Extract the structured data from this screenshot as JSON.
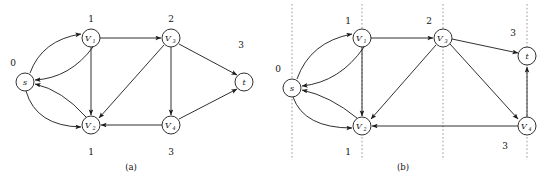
{
  "figure": {
    "type": "directed-graph-diagram",
    "panels": [
      {
        "id": "a",
        "caption": "(a)",
        "caption_x": 131,
        "caption_y": 170,
        "nodes": [
          {
            "id": "s",
            "label": "s",
            "sub": "",
            "cx": 25,
            "cy": 82,
            "r": 9,
            "dist": "0",
            "dist_x": 13,
            "dist_y": 62
          },
          {
            "id": "v1",
            "label": "V",
            "sub": "1",
            "cx": 91,
            "cy": 38,
            "r": 9,
            "dist": "1",
            "dist_x": 91,
            "dist_y": 18
          },
          {
            "id": "v3",
            "label": "V",
            "sub": "3",
            "cx": 171,
            "cy": 38,
            "r": 9,
            "dist": "2",
            "dist_x": 171,
            "dist_y": 18
          },
          {
            "id": "t",
            "label": "t",
            "sub": "",
            "cx": 244,
            "cy": 82,
            "r": 9,
            "dist": "3",
            "dist_x": 241,
            "dist_y": 44
          },
          {
            "id": "v2",
            "label": "V",
            "sub": "2",
            "cx": 91,
            "cy": 125,
            "r": 9,
            "dist": "1",
            "dist_x": 91,
            "dist_y": 153
          },
          {
            "id": "v4",
            "label": "V",
            "sub": "4",
            "cx": 171,
            "cy": 125,
            "r": 9,
            "dist": "3",
            "dist_x": 171,
            "dist_y": 153
          }
        ],
        "edges": [
          {
            "from": "s",
            "to": "v1",
            "shape": "curve-up"
          },
          {
            "from": "v1",
            "to": "s",
            "shape": "curve-down"
          },
          {
            "from": "s",
            "to": "v2",
            "shape": "curve-down"
          },
          {
            "from": "v2",
            "to": "s",
            "shape": "curve-up"
          },
          {
            "from": "v1",
            "to": "v3",
            "shape": "straight"
          },
          {
            "from": "v1",
            "to": "v2",
            "shape": "straight"
          },
          {
            "from": "v3",
            "to": "v2",
            "shape": "straight"
          },
          {
            "from": "v3",
            "to": "v4",
            "shape": "straight"
          },
          {
            "from": "v3",
            "to": "t",
            "shape": "straight"
          },
          {
            "from": "v4",
            "to": "v2",
            "shape": "straight"
          },
          {
            "from": "v4",
            "to": "t",
            "shape": "straight"
          }
        ],
        "dashed_lines": []
      },
      {
        "id": "b",
        "caption": "(b)",
        "caption_x": 403,
        "caption_y": 170,
        "nodes": [
          {
            "id": "s",
            "label": "s",
            "sub": "",
            "cx": 292,
            "cy": 88,
            "r": 9,
            "dist": "0",
            "dist_x": 278,
            "dist_y": 68
          },
          {
            "id": "v1",
            "label": "V",
            "sub": "1",
            "cx": 362,
            "cy": 38,
            "r": 9,
            "dist": "1",
            "dist_x": 348,
            "dist_y": 20
          },
          {
            "id": "v3",
            "label": "V",
            "sub": "3",
            "cx": 443,
            "cy": 38,
            "r": 9,
            "dist": "2",
            "dist_x": 429,
            "dist_y": 20
          },
          {
            "id": "t",
            "label": "t",
            "sub": "",
            "cx": 527,
            "cy": 56,
            "r": 9,
            "dist": "3",
            "dist_x": 513,
            "dist_y": 32
          },
          {
            "id": "v2",
            "label": "V",
            "sub": "2",
            "cx": 362,
            "cy": 126,
            "r": 9,
            "dist": "1",
            "dist_x": 348,
            "dist_y": 152
          },
          {
            "id": "v4",
            "label": "V",
            "sub": "4",
            "cx": 527,
            "cy": 126,
            "r": 9,
            "dist": "3",
            "dist_x": 505,
            "dist_y": 146
          }
        ],
        "edges": [
          {
            "from": "s",
            "to": "v1",
            "shape": "curve-up"
          },
          {
            "from": "v1",
            "to": "s",
            "shape": "curve-down"
          },
          {
            "from": "s",
            "to": "v2",
            "shape": "curve-down"
          },
          {
            "from": "v2",
            "to": "s",
            "shape": "curve-up"
          },
          {
            "from": "v1",
            "to": "v3",
            "shape": "straight"
          },
          {
            "from": "v1",
            "to": "v2",
            "shape": "straight"
          },
          {
            "from": "v3",
            "to": "v2",
            "shape": "straight"
          },
          {
            "from": "v3",
            "to": "v4",
            "shape": "straight"
          },
          {
            "from": "v3",
            "to": "t",
            "shape": "straight"
          },
          {
            "from": "v4",
            "to": "v2",
            "shape": "straight"
          },
          {
            "from": "v4",
            "to": "t",
            "shape": "straight"
          }
        ],
        "dashed_lines": [
          {
            "x": 292,
            "y1": 4,
            "y2": 160
          },
          {
            "x": 362,
            "y1": 4,
            "y2": 160
          },
          {
            "x": 443,
            "y1": 4,
            "y2": 160
          },
          {
            "x": 527,
            "y1": 4,
            "y2": 160
          }
        ]
      }
    ],
    "colors": {
      "stroke": "#1a1a1a",
      "node_fill": "#ffffff",
      "dashed": "#999999",
      "background": "#ffffff"
    }
  }
}
